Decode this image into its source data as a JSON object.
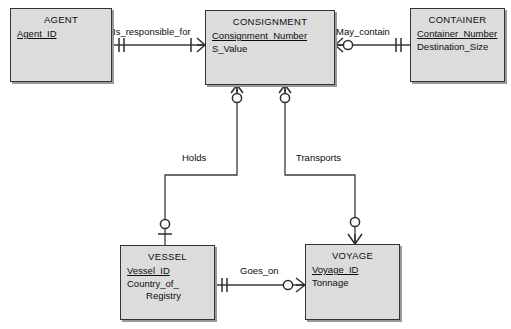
{
  "diagram": {
    "notation": "crows-foot",
    "background_color": "#ffffff",
    "entity_fill_color": "#dcdcdc",
    "entity_border_color": "#343434",
    "line_color": "#3a3a3a"
  },
  "entities": [
    {
      "id": "agent",
      "name": "AGENT",
      "attributes": [
        {
          "label": "Agent_ID",
          "primary_key": true
        }
      ]
    },
    {
      "id": "consignment",
      "name": "CONSIGNMENT",
      "attributes": [
        {
          "label": "Consignment_Number",
          "primary_key": true
        },
        {
          "label": "S_Value",
          "primary_key": false
        }
      ]
    },
    {
      "id": "container",
      "name": "CONTAINER",
      "attributes": [
        {
          "label": "Container_Number",
          "primary_key": true
        },
        {
          "label": "Destination_Size",
          "primary_key": false
        }
      ]
    },
    {
      "id": "vessel",
      "name": "VESSEL",
      "attributes": [
        {
          "label": "Vessel_ID",
          "primary_key": true
        },
        {
          "label": "Country_of_",
          "primary_key": false
        },
        {
          "label": "Registry",
          "primary_key": false
        }
      ]
    },
    {
      "id": "voyage",
      "name": "VOYAGE",
      "attributes": [
        {
          "label": "Voyage_ID",
          "primary_key": true
        },
        {
          "label": "Tonnage",
          "primary_key": false
        }
      ]
    }
  ],
  "relationships": [
    {
      "id": "is-responsible-for",
      "label": "Is_responsible_for",
      "from": "AGENT",
      "to": "CONSIGNMENT",
      "from_cardinality": "exactly-one",
      "to_cardinality": "one-or-many"
    },
    {
      "id": "may-contain",
      "label": "May_contain",
      "from": "CONSIGNMENT",
      "to": "CONTAINER",
      "from_cardinality": "zero-or-many",
      "to_cardinality": "exactly-one"
    },
    {
      "id": "holds",
      "label": "Holds",
      "from": "CONSIGNMENT",
      "to": "VESSEL",
      "from_cardinality": "zero-or-many",
      "to_cardinality": "zero-or-one"
    },
    {
      "id": "transports",
      "label": "Transports",
      "from": "CONSIGNMENT",
      "to": "VOYAGE",
      "from_cardinality": "zero-or-many",
      "to_cardinality": "zero-or-many"
    },
    {
      "id": "goes-on",
      "label": "Goes_on",
      "from": "VESSEL",
      "to": "VOYAGE",
      "from_cardinality": "exactly-one",
      "to_cardinality": "zero-or-many"
    }
  ]
}
